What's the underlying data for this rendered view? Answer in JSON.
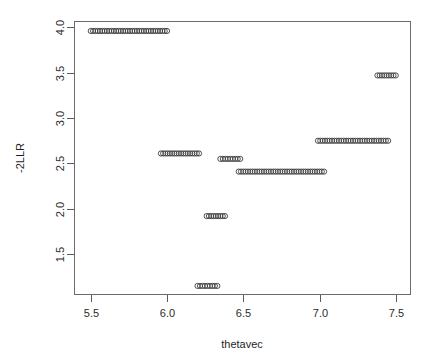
{
  "chart_data": {
    "type": "scatter",
    "title": "",
    "xlabel": "thetavec",
    "ylabel": "-2LLR",
    "xlim": [
      5.39,
      7.6
    ],
    "ylim": [
      1.05,
      4.07
    ],
    "xticks": [
      "5.5",
      "6.0",
      "6.5",
      "7.0",
      "7.5"
    ],
    "xtick_values": [
      5.5,
      6.0,
      6.5,
      7.0,
      7.5
    ],
    "yticks": [
      "1.5",
      "2.0",
      "2.5",
      "3.0",
      "3.5",
      "4.0"
    ],
    "ytick_values": [
      1.5,
      2.0,
      2.5,
      3.0,
      3.5,
      4.0
    ],
    "grid": false,
    "legend": "none",
    "marker": "open-circle",
    "marker_color": "#3d3d3d",
    "series": [
      {
        "name": "-2LLR vs thetavec",
        "segments": [
          {
            "y": 3.96,
            "x_start": 5.5,
            "x_end": 6.0,
            "n": 34
          },
          {
            "y": 3.47,
            "x_start": 7.38,
            "x_end": 7.5,
            "n": 9
          },
          {
            "y": 2.75,
            "x_start": 6.99,
            "x_end": 7.45,
            "n": 31
          },
          {
            "y": 2.61,
            "x_start": 5.96,
            "x_end": 6.21,
            "n": 18
          },
          {
            "y": 2.55,
            "x_start": 6.35,
            "x_end": 6.48,
            "n": 9
          },
          {
            "y": 2.41,
            "x_start": 6.47,
            "x_end": 7.03,
            "n": 38
          },
          {
            "y": 1.92,
            "x_start": 6.26,
            "x_end": 6.38,
            "n": 9
          },
          {
            "y": 1.15,
            "x_start": 6.2,
            "x_end": 6.33,
            "n": 9
          }
        ]
      }
    ]
  },
  "plot": {
    "frame": {
      "left": 74,
      "top": 21,
      "right": 411,
      "bottom": 295
    },
    "x_axis_name": "thetavec-axis",
    "y_axis_name": "-2LLR-axis"
  }
}
